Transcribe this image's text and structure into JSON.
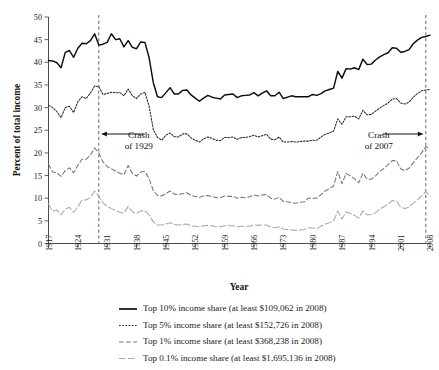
{
  "chart_data": {
    "type": "line",
    "title": "",
    "xlabel": "Year",
    "ylabel": "Percent of total income",
    "xlim": [
      1917,
      2008
    ],
    "ylim": [
      0,
      50
    ],
    "yticks": [
      0,
      5,
      10,
      15,
      20,
      25,
      30,
      35,
      40,
      45,
      50
    ],
    "xticks": [
      1917,
      1924,
      1931,
      1938,
      1945,
      1952,
      1959,
      1966,
      1973,
      1980,
      1987,
      1994,
      2001,
      2008
    ],
    "grid": false,
    "legend_position": "below",
    "x": [
      1917,
      1918,
      1919,
      1920,
      1921,
      1922,
      1923,
      1924,
      1925,
      1926,
      1927,
      1928,
      1929,
      1930,
      1931,
      1932,
      1933,
      1934,
      1935,
      1936,
      1937,
      1938,
      1939,
      1940,
      1941,
      1942,
      1943,
      1944,
      1945,
      1946,
      1947,
      1948,
      1949,
      1950,
      1951,
      1952,
      1953,
      1954,
      1955,
      1956,
      1957,
      1958,
      1959,
      1960,
      1961,
      1962,
      1963,
      1964,
      1965,
      1966,
      1967,
      1968,
      1969,
      1970,
      1971,
      1972,
      1973,
      1974,
      1975,
      1976,
      1977,
      1978,
      1979,
      1980,
      1981,
      1982,
      1983,
      1984,
      1985,
      1986,
      1987,
      1988,
      1989,
      1990,
      1991,
      1992,
      1993,
      1994,
      1995,
      1996,
      1997,
      1998,
      1999,
      2000,
      2001,
      2002,
      2003,
      2004,
      2005,
      2006,
      2007,
      2008
    ],
    "series": [
      {
        "name": "Top 10% income share (at least $109,062 in 2008)",
        "key": "top10",
        "style": "solid",
        "color": "#0d0d0d",
        "values": [
          40.4,
          40.3,
          39.9,
          38.8,
          42.2,
          42.6,
          41.1,
          43.1,
          44.2,
          44.1,
          44.8,
          46.3,
          43.8,
          44.0,
          44.4,
          46.3,
          45.0,
          45.2,
          43.4,
          44.8,
          43.3,
          43.0,
          44.5,
          44.4,
          41.0,
          35.5,
          32.4,
          32.2,
          33.3,
          34.4,
          33.0,
          33.0,
          33.8,
          33.9,
          32.8,
          32.1,
          31.4,
          32.1,
          32.7,
          32.3,
          32.1,
          31.9,
          32.8,
          32.9,
          33.0,
          32.2,
          32.6,
          32.7,
          32.8,
          33.3,
          32.6,
          33.2,
          33.7,
          32.6,
          32.6,
          33.4,
          32.0,
          32.3,
          32.6,
          32.4,
          32.4,
          32.4,
          32.4,
          32.9,
          32.7,
          33.1,
          33.7,
          34.0,
          34.3,
          38.0,
          36.5,
          38.6,
          38.5,
          38.8,
          38.4,
          40.7,
          39.5,
          39.6,
          40.5,
          41.2,
          41.7,
          42.1,
          43.2,
          43.1,
          42.2,
          42.4,
          42.8,
          44.1,
          44.9,
          45.5,
          45.7,
          46.0
        ]
      },
      {
        "name": "Top 5% income share (at least $152,726 in 2008)",
        "key": "top5",
        "style": "dotted",
        "color": "#2a2a2a",
        "values": [
          30.5,
          30.0,
          29.1,
          27.8,
          30.0,
          30.3,
          28.9,
          31.3,
          32.4,
          32.0,
          33.2,
          34.8,
          34.6,
          32.9,
          33.1,
          33.4,
          33.3,
          33.3,
          32.6,
          34.1,
          32.6,
          32.0,
          33.0,
          33.4,
          30.3,
          25.2,
          23.4,
          22.8,
          23.9,
          24.4,
          23.6,
          23.5,
          24.2,
          24.2,
          23.3,
          22.8,
          22.4,
          23.1,
          23.5,
          23.2,
          22.8,
          22.7,
          23.4,
          23.4,
          23.5,
          23.0,
          23.4,
          23.4,
          23.6,
          23.9,
          23.5,
          23.8,
          24.1,
          23.0,
          22.9,
          23.5,
          22.4,
          22.4,
          22.5,
          22.4,
          22.5,
          22.6,
          22.6,
          22.8,
          22.8,
          23.5,
          24.1,
          24.4,
          24.8,
          27.5,
          26.3,
          28.0,
          28.0,
          28.1,
          27.5,
          29.4,
          28.4,
          28.5,
          29.2,
          29.9,
          30.5,
          31.0,
          31.9,
          32.0,
          31.0,
          30.8,
          31.2,
          32.3,
          33.1,
          33.7,
          33.9,
          34.0
        ]
      },
      {
        "name": "Top 1% income share (at least $368,238 in 2008)",
        "key": "top1",
        "style": "dashed",
        "color": "#757575",
        "values": [
          17.5,
          15.8,
          15.6,
          14.8,
          16.1,
          16.7,
          15.6,
          17.3,
          18.6,
          18.6,
          19.5,
          21.1,
          20.0,
          18.0,
          17.0,
          16.5,
          16.0,
          15.5,
          15.2,
          17.2,
          15.5,
          14.9,
          15.8,
          15.9,
          14.3,
          11.7,
          10.6,
          10.5,
          11.0,
          11.6,
          10.9,
          10.8,
          11.0,
          11.2,
          10.6,
          10.4,
          10.2,
          10.5,
          10.6,
          10.4,
          10.1,
          10.1,
          10.5,
          10.4,
          10.4,
          10.0,
          10.2,
          10.1,
          10.3,
          10.7,
          10.5,
          10.7,
          10.8,
          10.0,
          9.8,
          10.2,
          9.3,
          9.2,
          9.0,
          8.9,
          9.1,
          9.2,
          10.0,
          10.0,
          10.0,
          10.8,
          11.6,
          12.1,
          12.7,
          15.9,
          13.2,
          15.5,
          14.9,
          14.3,
          13.4,
          15.5,
          14.2,
          14.2,
          14.9,
          15.9,
          16.6,
          17.4,
          18.3,
          18.3,
          16.5,
          16.1,
          16.6,
          17.8,
          18.9,
          20.0,
          21.4,
          20.9
        ]
      },
      {
        "name": "Top 0.1% income share (at least $1,695,136 in 2008)",
        "key": "top01",
        "style": "longdash",
        "color": "#a8a8a8",
        "values": [
          8.7,
          7.1,
          7.4,
          6.3,
          7.6,
          8.0,
          6.9,
          8.1,
          9.6,
          9.6,
          10.2,
          11.6,
          10.4,
          9.0,
          8.2,
          7.7,
          7.3,
          6.9,
          6.7,
          8.2,
          7.0,
          6.6,
          7.2,
          7.2,
          6.3,
          4.8,
          4.1,
          4.1,
          4.3,
          4.6,
          4.2,
          4.1,
          4.2,
          4.3,
          3.9,
          3.8,
          3.7,
          3.9,
          4.0,
          3.9,
          3.7,
          3.7,
          3.9,
          3.9,
          3.9,
          3.7,
          3.8,
          3.8,
          3.8,
          4.1,
          4.0,
          4.1,
          4.1,
          3.6,
          3.5,
          3.7,
          3.2,
          3.1,
          3.0,
          2.9,
          3.0,
          3.1,
          3.5,
          3.4,
          3.3,
          3.8,
          4.3,
          4.6,
          5.0,
          7.2,
          5.4,
          7.0,
          6.6,
          6.2,
          5.6,
          7.2,
          6.3,
          6.4,
          6.8,
          7.6,
          8.1,
          8.7,
          9.5,
          9.4,
          8.0,
          7.7,
          8.0,
          8.9,
          9.6,
          10.5,
          11.5,
          10.4
        ]
      }
    ],
    "annotations": [
      {
        "key": "crash1929",
        "line1": "Crash",
        "line2": "of 1929",
        "year": 1929,
        "arrow_direction": "left"
      },
      {
        "key": "crash2007",
        "line1": "Crash",
        "line2": "of 2007",
        "year": 2007,
        "arrow_direction": "right"
      }
    ]
  },
  "legend": {
    "items": [
      {
        "label": "Top 10% income share (at least $109,062 in 2008)",
        "style": "solid"
      },
      {
        "label": "Top 5% income share (at least $152,726 in 2008)",
        "style": "dotted"
      },
      {
        "label": "Top 1% income share (at least $368,238 in 2008)",
        "style": "dashed"
      },
      {
        "label": "Top 0.1% income share (at least $1,695,136 in 2008)",
        "style": "longdash"
      }
    ]
  }
}
